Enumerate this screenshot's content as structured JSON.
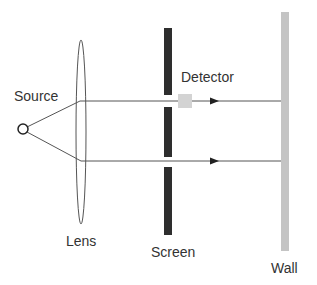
{
  "labels": {
    "source": "Source",
    "lens": "Lens",
    "detector": "Detector",
    "screen": "Screen",
    "wall": "Wall"
  },
  "colors": {
    "line": "#555555",
    "screen": "#2e2e2e",
    "detector": "#d3d3d3",
    "wall": "#c4c4c4",
    "text": "#333333"
  }
}
